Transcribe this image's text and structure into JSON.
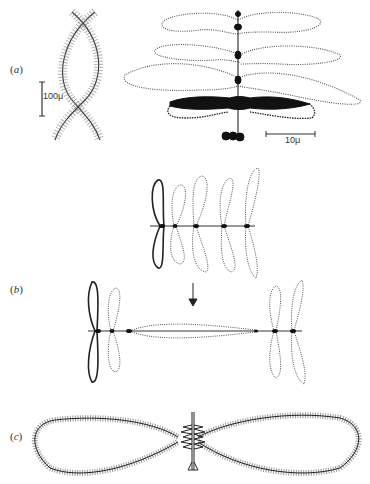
{
  "figure": {
    "panels": [
      {
        "id": "a",
        "label_open": "(",
        "label_letter": "a",
        "label_close": ")"
      },
      {
        "id": "b",
        "label_open": "(",
        "label_letter": "b",
        "label_close": ")"
      },
      {
        "id": "c",
        "label_open": "(",
        "label_letter": "c",
        "label_close": ")"
      }
    ],
    "scale_bars": {
      "a_left": "100μ",
      "a_right": "10μ"
    },
    "colors": {
      "ink": "#222222",
      "loop": "#555555",
      "background": "#ffffff"
    }
  }
}
